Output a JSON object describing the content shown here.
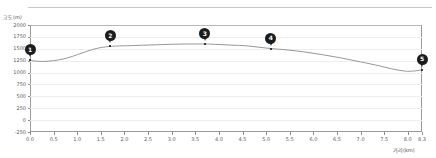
{
  "chart_data": {
    "type": "line",
    "title": "",
    "xlabel": "거리(km)",
    "ylabel": "고도(m)",
    "xlim": [
      0.0,
      8.3
    ],
    "ylim": [
      -250,
      2000
    ],
    "grid": true,
    "legend": "none",
    "x_ticks": [
      "0.0",
      "0.5",
      "1.0",
      "1.5",
      "2.0",
      "2.5",
      "3.0",
      "3.5",
      "4.0",
      "4.5",
      "5.0",
      "5.5",
      "6.0",
      "6.5",
      "7.0",
      "7.5",
      "8.0",
      "8.3"
    ],
    "x_tick_values": [
      0.0,
      0.5,
      1.0,
      1.5,
      2.0,
      2.5,
      3.0,
      3.5,
      4.0,
      4.5,
      5.0,
      5.5,
      6.0,
      6.5,
      7.0,
      7.5,
      8.0,
      8.3
    ],
    "y_ticks": [
      "2000",
      "1750",
      "1500",
      "1250",
      "1000",
      "750",
      "500",
      "250",
      "0",
      "-250"
    ],
    "y_tick_values": [
      2000,
      1750,
      1500,
      1250,
      1000,
      750,
      500,
      250,
      0,
      -250
    ],
    "series": [
      {
        "name": "고도",
        "color": "#8a8a8a",
        "x": [
          0.0,
          0.2,
          0.4,
          0.6,
          0.8,
          1.0,
          1.2,
          1.4,
          1.6,
          1.7,
          1.9,
          2.1,
          2.4,
          2.7,
          3.0,
          3.3,
          3.7,
          4.0,
          4.3,
          4.6,
          5.1,
          5.4,
          5.8,
          6.2,
          6.6,
          7.0,
          7.4,
          7.7,
          7.95,
          8.1,
          8.3
        ],
        "y": [
          1255,
          1235,
          1240,
          1265,
          1310,
          1375,
          1445,
          1505,
          1540,
          1550,
          1560,
          1565,
          1575,
          1585,
          1595,
          1600,
          1600,
          1590,
          1575,
          1560,
          1505,
          1480,
          1435,
          1375,
          1305,
          1225,
          1140,
          1070,
          1030,
          1030,
          1055
        ]
      }
    ],
    "markers": [
      {
        "label": "1",
        "x": 0.0,
        "y": 1255
      },
      {
        "label": "2",
        "x": 1.7,
        "y": 1550
      },
      {
        "label": "3",
        "x": 3.7,
        "y": 1600
      },
      {
        "label": "4",
        "x": 5.1,
        "y": 1505
      },
      {
        "label": "5",
        "x": 8.3,
        "y": 1055
      }
    ]
  }
}
